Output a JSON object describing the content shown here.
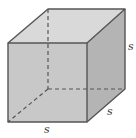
{
  "figure": {
    "type": "cube",
    "colors": {
      "top_face": "#d9d9d9",
      "right_face": "#b4b4b4",
      "front_face": "#c8c8c8",
      "edge": "#555555",
      "hidden_edge": "#555555",
      "label": "#3a3a3a"
    },
    "labels": {
      "height": "s",
      "depth": "s",
      "width": "s"
    }
  }
}
